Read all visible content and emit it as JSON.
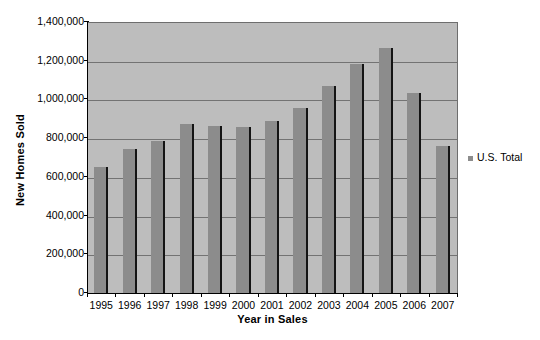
{
  "chart_data": {
    "type": "bar",
    "title": "",
    "xlabel": "Year in Sales",
    "ylabel": "New Homes Sold",
    "categories": [
      "1995",
      "1996",
      "1997",
      "1998",
      "1999",
      "2000",
      "2001",
      "2002",
      "2003",
      "2004",
      "2005",
      "2006",
      "2007"
    ],
    "series": [
      {
        "name": "U.S. Total",
        "values": [
          655000,
          750000,
          790000,
          880000,
          870000,
          865000,
          895000,
          960000,
          1075000,
          1190000,
          1270000,
          1040000,
          765000
        ]
      }
    ],
    "ylim": [
      0,
      1400000
    ],
    "ytick_values": [
      0,
      200000,
      400000,
      600000,
      800000,
      1000000,
      1200000,
      1400000
    ],
    "ytick_labels": [
      "0",
      "200,000",
      "400,000",
      "600,000",
      "800,000",
      "1,000,000",
      "1,200,000",
      "1,400,000"
    ],
    "grid": true,
    "legend_position": "right",
    "colors": {
      "bar": "#8c8c8c",
      "bar_edge": "#141414",
      "plot_background": "#bdbdbd",
      "gridline": "#737373",
      "axis": "#000000",
      "page_background": "#ffffff",
      "text": "#000000"
    }
  },
  "legend": {
    "entries": [
      {
        "label": "U.S. Total",
        "marker": "legend-square-marker"
      }
    ]
  }
}
